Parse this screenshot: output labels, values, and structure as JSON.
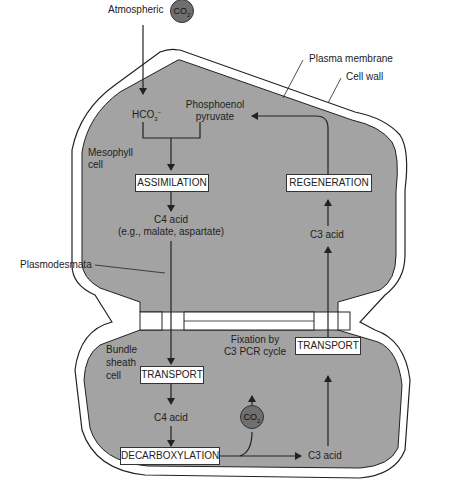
{
  "diagram": {
    "labels": {
      "atmospheric": "Atmospheric",
      "co2_atmospheric": "CO",
      "co2_sub": "2",
      "hco3": "HCO",
      "hco3_sub": "3",
      "hco3_sup": "−",
      "phosphoenol_pyruvate_line1": "Phosphoenol",
      "phosphoenol_pyruvate_line2": "pyruvate",
      "plasma_membrane": "Plasma membrane",
      "cell_wall": "Cell wall",
      "mesophyll_cell_line1": "Mesophyll",
      "mesophyll_cell_line2": "cell",
      "c4_acid_top_line1": "C4 acid",
      "c4_acid_top_line2": "(e.g., malate, aspartate)",
      "plasmodesmata": "Plasmodesmata",
      "c3_acid_top": "C3 acid",
      "bundle_sheath_line1": "Bundle",
      "bundle_sheath_line2": "sheath",
      "bundle_sheath_line3": "cell",
      "c4_acid_bottom": "C4 acid",
      "fixation_line1": "Fixation by",
      "fixation_line2": "C3 PCR cycle",
      "co2_bundle": "CO",
      "c3_acid_bottom": "C3 acid"
    },
    "boxes": {
      "assimilation": "ASSIMILATION",
      "regeneration": "REGENERATION",
      "transport_left": "TRANSPORT",
      "transport_right": "TRANSPORT",
      "decarboxylation": "DECARBOXYLATION"
    },
    "colors": {
      "cell_fill": "#a3a3a3",
      "co2_fill": "#6f6f6f",
      "line": "#222222",
      "box_fill": "#ffffff"
    }
  }
}
